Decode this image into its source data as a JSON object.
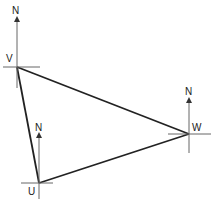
{
  "diagram": {
    "type": "bearing-triangle",
    "points": [
      {
        "id": "V",
        "label": "V",
        "north_label": "N"
      },
      {
        "id": "W",
        "label": "W",
        "north_label": "N"
      },
      {
        "id": "U",
        "label": "U",
        "north_label": "N"
      }
    ],
    "edges": [
      [
        "V",
        "W"
      ],
      [
        "W",
        "U"
      ],
      [
        "U",
        "V"
      ]
    ],
    "colors": {
      "line": "#222222",
      "axis": "#666666",
      "background": "#ffffff"
    }
  }
}
